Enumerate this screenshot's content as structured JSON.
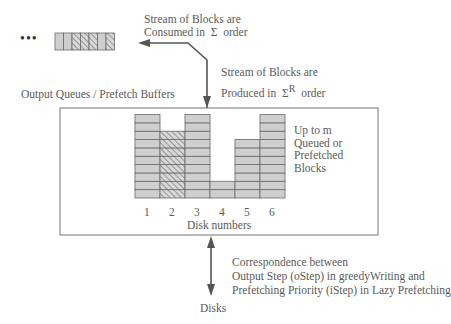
{
  "stream": {
    "ellipsis": "•••",
    "blocks": [
      "plain",
      "plain",
      "hatched",
      "hatched",
      "hatched",
      "plain",
      "hatched"
    ]
  },
  "labels": {
    "consumed_line1": "Stream of Blocks are",
    "consumed_line2_prefix": "Consumed in",
    "consumed_sigma": "Σ",
    "consumed_line2_suffix": "order",
    "produced_line1": "Stream of Blocks are",
    "produced_line2_prefix": "Produced in",
    "produced_sigma": "Σ",
    "produced_superscript": "R",
    "produced_line2_suffix": "order",
    "buffers_title": "Output Queues / Prefetch Buffers",
    "capacity_line1": "Up to m",
    "capacity_line2": "Queued or",
    "capacity_line3": "Prefetched",
    "capacity_line4": "Blocks",
    "axis_title": "Disk numbers",
    "corr_line1": "Correspondence between",
    "corr_line2": "Output Step (oStep) in greedyWriting and",
    "corr_line3": "Prefetching Priority (iStep) in Lazy Prefetching",
    "disks": "Disks"
  },
  "disks": [
    {
      "label": "1",
      "blocks": 10,
      "pattern": "plain"
    },
    {
      "label": "2",
      "blocks": 8,
      "pattern": "hatched"
    },
    {
      "label": "3",
      "blocks": 10,
      "pattern": "plain"
    },
    {
      "label": "4",
      "blocks": 2,
      "pattern": "plain"
    },
    {
      "label": "5",
      "blocks": 7,
      "pattern": "plain"
    },
    {
      "label": "6",
      "blocks": 10,
      "pattern": "plain"
    }
  ],
  "colors": {
    "block_fill": "#cfcfcf",
    "block_line": "#6a6a6a",
    "arrow": "#555555",
    "frame": "#777777"
  }
}
